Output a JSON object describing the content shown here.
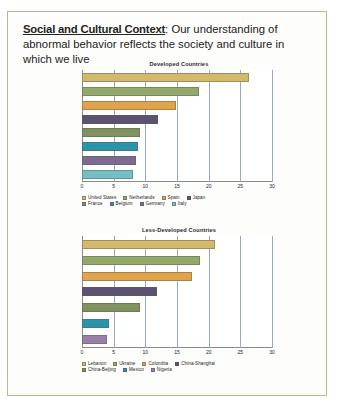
{
  "slide": {
    "header": {
      "lead": "Social and Cultural Context",
      "rest": ": Our understanding of abnormal behavior reflects the society and culture in which we live"
    }
  },
  "chart_data": [
    {
      "id": "developed",
      "type": "bar",
      "orientation": "horizontal",
      "title": "Developed Countries",
      "xlabel": "",
      "ylabel": "",
      "xlim": [
        0,
        30
      ],
      "xticks": [
        0,
        5,
        10,
        15,
        20,
        25,
        30
      ],
      "xtick_labels": [
        "0",
        "5",
        "10",
        "15",
        "20",
        "25",
        "30"
      ],
      "grid": true,
      "legend_position": "bottom",
      "categories": [
        "United States",
        "Netherlands",
        "Spain",
        "Japan",
        "France",
        "Belgium",
        "Germany",
        "Italy"
      ],
      "values": [
        26.4,
        18.4,
        14.9,
        12.0,
        9.1,
        8.8,
        8.6,
        8.0
      ],
      "colors": [
        "#d4b96b",
        "#93a96a",
        "#e2a44a",
        "#5c5372",
        "#7f915c",
        "#2a94a8",
        "#7d6a91",
        "#74bfc4"
      ]
    },
    {
      "id": "less-developed",
      "type": "bar",
      "orientation": "horizontal",
      "title": "Less-Developed Countries",
      "xlabel": "",
      "ylabel": "",
      "xlim": [
        0,
        30
      ],
      "xticks": [
        0,
        5,
        10,
        15,
        20,
        25,
        30
      ],
      "xtick_labels": [
        "0",
        "5",
        "10",
        "15",
        "20",
        "25",
        "30"
      ],
      "grid": true,
      "legend_position": "bottom",
      "categories": [
        "Lebanon",
        "Ukraine",
        "Colombia",
        "China-Shanghai",
        "China-Beijing",
        "Mexico",
        "Nigeria"
      ],
      "values": [
        21.0,
        18.6,
        17.4,
        11.8,
        9.2,
        4.2,
        4.0
      ],
      "colors": [
        "#d4b96b",
        "#93a96a",
        "#e2a44a",
        "#5c5372",
        "#7f915c",
        "#2a94a8",
        "#9a7fa8"
      ]
    }
  ]
}
